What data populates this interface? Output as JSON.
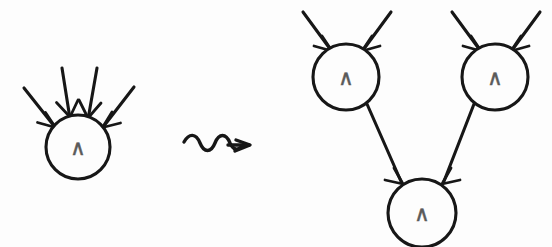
{
  "figure": {
    "background_color": "#fdfdfd",
    "stroke_color": "#171717",
    "label_color": "#5a5a5a",
    "width": 552,
    "height": 247
  },
  "rewrite_operator": {
    "name": "squiggly-rewrites-to-arrow",
    "symbol": "⇝",
    "x": 182,
    "y": 145
  },
  "left_side": {
    "caption": "single AND node with four inputs",
    "nodes": [
      {
        "id": "lhs-and",
        "label": "∧",
        "cx": 78,
        "cy": 147,
        "r": 32,
        "incoming_count": 4
      }
    ],
    "input_arrows": [
      {
        "id": "lhs-in-1",
        "x1": 24,
        "y1": 88,
        "x2": 54,
        "y2": 126
      },
      {
        "id": "lhs-in-2",
        "x1": 62,
        "y1": 68,
        "x2": 69,
        "y2": 115
      },
      {
        "id": "lhs-in-3",
        "x1": 97,
        "y1": 68,
        "x2": 88,
        "y2": 116
      },
      {
        "id": "lhs-in-4",
        "x1": 134,
        "y1": 87,
        "x2": 103,
        "y2": 126
      }
    ]
  },
  "right_side": {
    "caption": "two AND nodes feeding one AND node",
    "nodes": [
      {
        "id": "rhs-and-upper-left",
        "label": "∧",
        "cx": 346,
        "cy": 77,
        "r": 33,
        "incoming_count": 2
      },
      {
        "id": "rhs-and-upper-right",
        "label": "∧",
        "cx": 495,
        "cy": 77,
        "r": 33,
        "incoming_count": 2
      },
      {
        "id": "rhs-and-bottom",
        "label": "∧",
        "cx": 422,
        "cy": 213,
        "r": 34,
        "incoming_count": 2
      }
    ],
    "input_arrows": [
      {
        "id": "rhs-in-1",
        "x1": 303,
        "y1": 12,
        "x2": 330,
        "y2": 49
      },
      {
        "id": "rhs-in-2",
        "x1": 391,
        "y1": 12,
        "x2": 363,
        "y2": 49
      },
      {
        "id": "rhs-in-3",
        "x1": 452,
        "y1": 12,
        "x2": 479,
        "y2": 49
      },
      {
        "id": "rhs-in-4",
        "x1": 540,
        "y1": 12,
        "x2": 512,
        "y2": 49
      }
    ],
    "internal_edges": [
      {
        "id": "rhs-edge-left",
        "from": "rhs-and-upper-left",
        "to": "rhs-and-bottom",
        "x1": 367,
        "y1": 104,
        "x2": 401,
        "y2": 182
      },
      {
        "id": "rhs-edge-right",
        "from": "rhs-and-upper-right",
        "to": "rhs-and-bottom",
        "x1": 474,
        "y1": 104,
        "x2": 444,
        "y2": 182
      }
    ]
  }
}
